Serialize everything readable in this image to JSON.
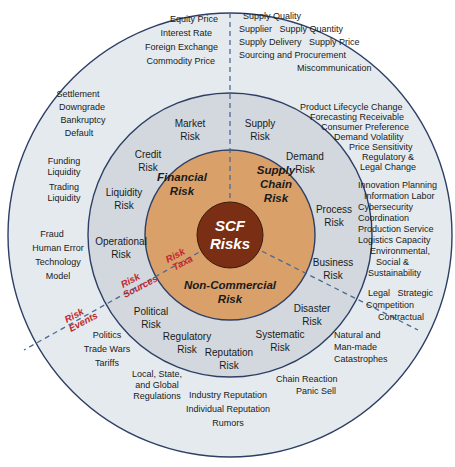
{
  "colors": {
    "outer_ring": "#e4eaee",
    "middle_ring": "#d2d8de",
    "core_ring": "#d9a06a",
    "center": "#7a2e14",
    "stroke": "#2e3f66",
    "dash": "#4a6a9a",
    "tag_red": "#c0272d"
  },
  "center": {
    "line1": "SCF",
    "line2": "Risks"
  },
  "taxa": {
    "financial": {
      "line1": "Financial",
      "line2": "Risk"
    },
    "supply_chain": {
      "line1": "Supply",
      "line2": "Chain",
      "line3": "Risk"
    },
    "non_commercial": {
      "line1": "Non-Commercial",
      "line2": "Risk"
    }
  },
  "layer_tags": {
    "taxa": {
      "line1": "Risk",
      "line2": "Taxa"
    },
    "sources": {
      "line1": "Risk",
      "line2": "Sources"
    },
    "events": {
      "line1": "Risk",
      "line2": "Events"
    }
  },
  "sources": {
    "market": {
      "line1": "Market",
      "line2": "Risk"
    },
    "credit": {
      "line1": "Credit",
      "line2": "Risk"
    },
    "liquidity": {
      "line1": "Liquidity",
      "line2": "Risk"
    },
    "operational": {
      "line1": "Operational",
      "line2": "Risk"
    },
    "supply": {
      "line1": "Supply",
      "line2": "Risk"
    },
    "demand": {
      "line1": "Demand",
      "line2": "Risk"
    },
    "process": {
      "line1": "Process",
      "line2": "Risk"
    },
    "business": {
      "line1": "Business",
      "line2": "Risk"
    },
    "disaster": {
      "line1": "Disaster",
      "line2": "Risk"
    },
    "systematic": {
      "line1": "Systematic",
      "line2": "Risk"
    },
    "reputation": {
      "line1": "Reputation",
      "line2": "Risk"
    },
    "regulatory": {
      "line1": "Regulatory",
      "line2": "Risk"
    },
    "political": {
      "line1": "Political",
      "line2": "Risk"
    }
  },
  "events": {
    "market": [
      "Equity Price",
      "Interest Rate",
      "Foreign Exchange",
      "Commodity Price"
    ],
    "credit": [
      "Settlement",
      "Downgrade",
      "Bankruptcy",
      "Default"
    ],
    "liquidity": [
      "Funding",
      "Liquidity",
      "Trading",
      "Liquidity"
    ],
    "operational": [
      "Fraud",
      "Human Error",
      "Technology",
      "Model"
    ],
    "supply": [
      "Supply Quality",
      "Supplier   Supply Quantity",
      "Supply Delivery   Supply Price",
      "Sourcing and Procurement",
      "Miscommunication"
    ],
    "demand": [
      "Product Lifecycle Change",
      "Forecasting  Receivable",
      "Consumer Preference",
      "Demand Volatility",
      "Price Sensitivity",
      "Regulatory &",
      "Legal Change"
    ],
    "process": [
      "Innovation  Planning",
      "Information  Labor",
      "Cybersecurity",
      "Coordination",
      "Production Service",
      "Logistics  Capacity",
      "Environmental,",
      "Social &",
      "Sustainability"
    ],
    "business": [
      "Legal   Strategic",
      "Competition",
      "Contractual"
    ],
    "disaster": [
      "Natural and",
      "Man-made",
      "Catastrophes"
    ],
    "systematic": [
      "Chain Reaction",
      "Panic Sell"
    ],
    "reputation": [
      "Industry Reputation",
      "Individual Reputation",
      "Rumors"
    ],
    "regulatory": [
      "Local, State,",
      "and Global",
      "Regulations"
    ],
    "political": [
      "Politics",
      "Trade Wars",
      "Tariffs"
    ]
  }
}
